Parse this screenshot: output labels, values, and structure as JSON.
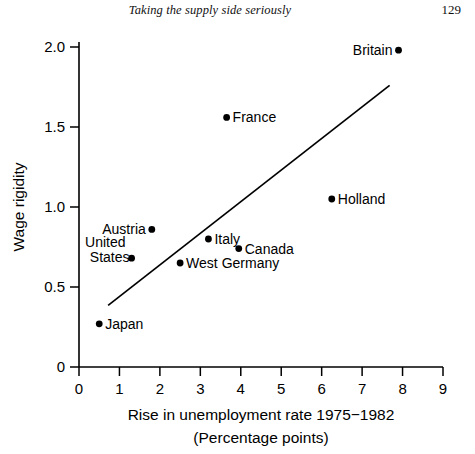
{
  "header": {
    "running_head": "Taking the supply side seriously",
    "page_number": "129"
  },
  "chart_data": {
    "type": "scatter",
    "title": "",
    "xlabel_line1": "Rise in unemployment rate 1975−1982",
    "xlabel_line2": "(Percentage points)",
    "ylabel": "Wage rigidity",
    "xlim": [
      0,
      9
    ],
    "ylim": [
      0,
      2.0
    ],
    "grid": false,
    "legend": "none",
    "xticks": [
      "0",
      "1",
      "2",
      "3",
      "4",
      "5",
      "6",
      "7",
      "8",
      "9"
    ],
    "xtick_values": [
      0,
      1,
      2,
      3,
      4,
      5,
      6,
      7,
      8,
      9
    ],
    "yticks": [
      "0",
      "0.5",
      "1.0",
      "1.5",
      "2.0"
    ],
    "ytick_values": [
      0,
      0.5,
      1.0,
      1.5,
      2.0
    ],
    "points": [
      {
        "label": "Britain",
        "x": 7.9,
        "y": 1.98,
        "label_side": "left"
      },
      {
        "label": "France",
        "x": 3.65,
        "y": 1.56,
        "label_side": "right"
      },
      {
        "label": "Holland",
        "x": 6.25,
        "y": 1.05,
        "label_side": "right"
      },
      {
        "label": "Austria",
        "x": 1.8,
        "y": 0.86,
        "label_side": "left"
      },
      {
        "label": "Italy",
        "x": 3.2,
        "y": 0.8,
        "label_side": "right"
      },
      {
        "label": "Canada",
        "x": 3.95,
        "y": 0.74,
        "label_side": "right"
      },
      {
        "label": "United States",
        "x": 1.3,
        "y": 0.68,
        "label_side": "left-two-line"
      },
      {
        "label": "West Germany",
        "x": 2.5,
        "y": 0.65,
        "label_side": "right"
      },
      {
        "label": "Japan",
        "x": 0.5,
        "y": 0.27,
        "label_side": "right"
      }
    ],
    "trend_line": {
      "x0": 0.72,
      "y0": 0.385,
      "x1": 7.68,
      "y1": 1.76
    }
  }
}
